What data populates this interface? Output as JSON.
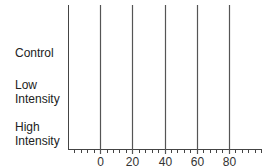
{
  "chart_data": {
    "type": "bar",
    "orientation": "horizontal",
    "title": "",
    "xlabel": "",
    "ylabel": "",
    "categories": [
      "Control",
      "Low Intensity",
      "High Intensity"
    ],
    "category_lines": [
      [
        "Control"
      ],
      [
        "Low",
        "Intensity"
      ],
      [
        "High",
        "Intensity"
      ]
    ],
    "values": [
      null,
      null,
      null
    ],
    "xlim": [
      -20,
      100
    ],
    "major_ticks": [
      0,
      20,
      40,
      60,
      80
    ],
    "minor_tick_step": 4,
    "grid": "vertical lines at major ticks",
    "legend": null
  },
  "colors": {
    "axis": "#444444",
    "grid": "#555555",
    "text": "#222222"
  }
}
